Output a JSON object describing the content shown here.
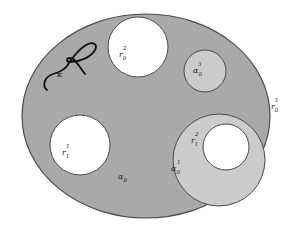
{
  "diagram": {
    "colors": {
      "background": "#ffffff",
      "outer_region": "#a9a9a9",
      "light_region": "#cbcbcb",
      "hole": "#ffffff",
      "outline": "#4a4a4a",
      "curve": "#111111"
    },
    "outer_region": {
      "label_base": "α",
      "label_sub": "0",
      "label_sup": ""
    },
    "outer_boundary": {
      "label_base": "r",
      "label_sub": "0",
      "label_sup": "1"
    },
    "holes": [
      {
        "id": "top",
        "label_base": "r",
        "label_sub": "0",
        "label_sup": "2"
      },
      {
        "id": "left",
        "label_base": "r",
        "label_sub": "1",
        "label_sup": "1"
      },
      {
        "id": "inner",
        "label_base": "r",
        "label_sub": "1",
        "label_sup": "2"
      }
    ],
    "sub_regions": [
      {
        "id": "small",
        "label_base": "α",
        "label_sub": "0",
        "label_sup": "3"
      },
      {
        "id": "large",
        "label_base": "α",
        "label_sub": "0",
        "label_sup": "1"
      }
    ],
    "curve": {
      "label": "κ"
    }
  }
}
